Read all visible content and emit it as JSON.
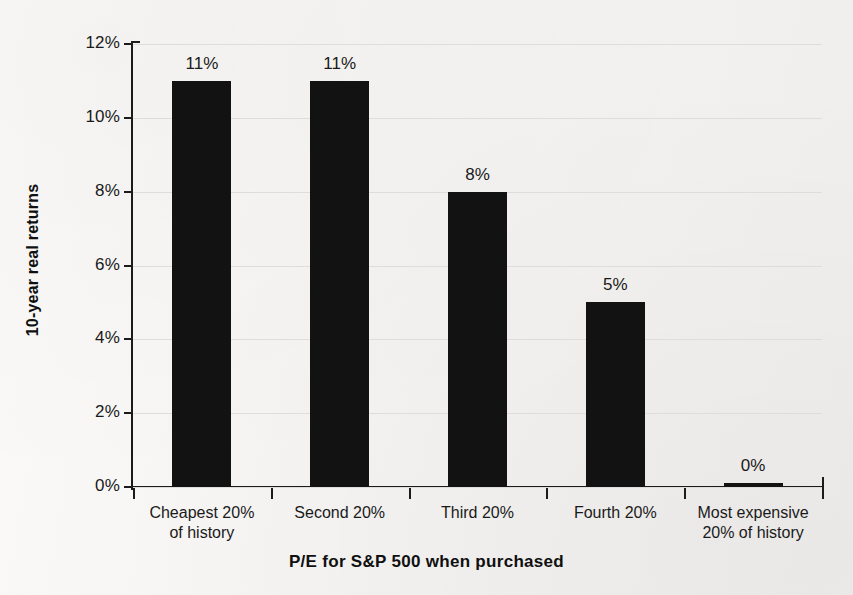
{
  "chart_data": {
    "type": "bar",
    "title": "",
    "xlabel": "P/E for S&P 500 when purchased",
    "ylabel": "10-year real returns",
    "categories": [
      "Cheapest 20%\nof history",
      "Second 20%",
      "Third 20%",
      "Fourth 20%",
      "Most expensive\n20% of history"
    ],
    "category_lines": [
      [
        "Cheapest 20%",
        "of history"
      ],
      [
        "Second 20%",
        ""
      ],
      [
        "Third 20%",
        ""
      ],
      [
        "Fourth 20%",
        ""
      ],
      [
        "Most expensive",
        "20% of history"
      ]
    ],
    "values": [
      11,
      11,
      8,
      5,
      0
    ],
    "value_labels": [
      "11%",
      "11%",
      "8%",
      "5%",
      "0%"
    ],
    "ylim": [
      0,
      12
    ],
    "ytick_values": [
      0,
      2,
      4,
      6,
      8,
      10,
      12
    ],
    "ytick_labels": [
      "0%",
      "2%",
      "4%",
      "6%",
      "8%",
      "10%",
      "12%"
    ],
    "grid": true,
    "legend": "none",
    "bar_color": "#121212",
    "gridline_color": "#dedddb",
    "axis_color": "#1b1b1b",
    "background_color": "#f6f5f3"
  }
}
